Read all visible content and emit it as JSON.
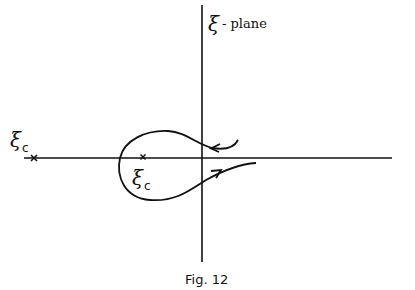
{
  "figure": {
    "plane_label_symbol": "ξ",
    "plane_label_text": "- plane",
    "caption": "Fig. 12",
    "points": [
      {
        "symbol": "ξ",
        "subscript": "c",
        "marker": "×",
        "position": "far-left on real axis"
      },
      {
        "symbol": "ξ",
        "subscript": "c",
        "marker": "×",
        "position": "left of origin, inside loop"
      }
    ],
    "contour": {
      "description": "Loop contour from right above real axis, around the inner ξc point, returning right below the real axis",
      "arrows": [
        "leftward on upper branch",
        "rightward on lower branch"
      ]
    },
    "line_color": "#111111"
  }
}
